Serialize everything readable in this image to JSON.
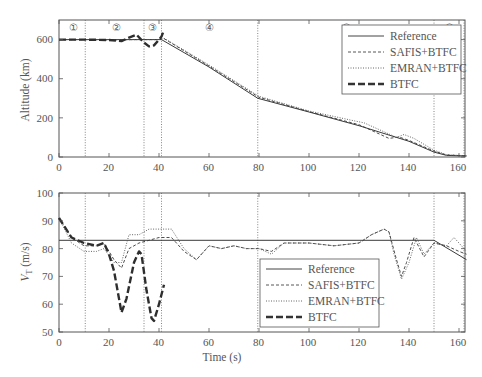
{
  "chart_data": [
    {
      "type": "line",
      "title": "",
      "xlabel": "",
      "ylabel": "Altitude (km)",
      "xlim": [
        0,
        163
      ],
      "ylim": [
        0,
        700
      ],
      "xticks": [
        0,
        20,
        40,
        60,
        80,
        100,
        120,
        140,
        160
      ],
      "yticks": [
        0,
        200,
        400,
        600
      ],
      "grid": false,
      "legend_position": "upper right",
      "phase_markers": [
        {
          "label": "①",
          "x": 5
        },
        {
          "label": "②",
          "x": 23
        },
        {
          "label": "③",
          "x": 37.5
        },
        {
          "label": "④",
          "x": 60
        },
        {
          "label": "⑤",
          "x": 115
        },
        {
          "label": "⑥",
          "x": 156
        }
      ],
      "vertical_lines": [
        10.5,
        34,
        41,
        79.5,
        150,
        162
      ],
      "series": [
        {
          "name": "Reference",
          "style": "solid",
          "x": [
            0,
            10,
            20,
            30,
            40,
            41,
            60,
            79.5,
            100,
            120,
            140,
            150,
            155,
            163
          ],
          "y": [
            600,
            600,
            600,
            600,
            600,
            600,
            460,
            300,
            230,
            160,
            80,
            25,
            8,
            5
          ]
        },
        {
          "name": "SAFIS+BTFC",
          "style": "dashed",
          "x": [
            0,
            10,
            20,
            30,
            40,
            42,
            60,
            80,
            100,
            120,
            132,
            136,
            140,
            150,
            155,
            163
          ],
          "y": [
            600,
            600,
            598,
            600,
            600,
            605,
            465,
            305,
            232,
            165,
            95,
            102,
            85,
            30,
            10,
            6
          ]
        },
        {
          "name": "EMRAN+BTFC",
          "style": "dotted",
          "x": [
            0,
            10,
            20,
            30,
            40,
            42,
            60,
            80,
            100,
            118,
            122,
            135,
            138,
            142,
            150,
            155,
            163
          ],
          "y": [
            600,
            600,
            600,
            600,
            600,
            607,
            470,
            310,
            235,
            185,
            175,
            100,
            115,
            95,
            35,
            12,
            6
          ]
        },
        {
          "name": "BTFC",
          "style": "thick-dashed",
          "x": [
            0,
            10,
            20,
            25,
            28,
            31,
            34,
            36,
            38,
            40,
            41,
            42
          ],
          "y": [
            600,
            600,
            598,
            592,
            610,
            625,
            585,
            565,
            570,
            600,
            615,
            650
          ]
        }
      ]
    },
    {
      "type": "line",
      "title": "",
      "xlabel": "Time (s)",
      "ylabel": "V_T (m/s)",
      "xlim": [
        0,
        163
      ],
      "ylim": [
        50,
        100
      ],
      "xticks": [
        0,
        20,
        40,
        60,
        80,
        100,
        120,
        140,
        160
      ],
      "yticks": [
        50,
        60,
        70,
        80,
        90,
        100
      ],
      "grid": false,
      "legend_position": "lower center-right",
      "vertical_lines": [
        10.5,
        34,
        41,
        79.5,
        150,
        162
      ],
      "series": [
        {
          "name": "Reference",
          "style": "solid",
          "x": [
            0,
            150,
            163
          ],
          "y": [
            83,
            83,
            76
          ]
        },
        {
          "name": "SAFIS+BTFC",
          "style": "dashed",
          "x": [
            0,
            5,
            10,
            15,
            18,
            22,
            25,
            28,
            32,
            36,
            40,
            45,
            50,
            55,
            60,
            65,
            70,
            75,
            80,
            85,
            90,
            100,
            110,
            120,
            125,
            130,
            132,
            135,
            137,
            139,
            142,
            146,
            150,
            155,
            160,
            163
          ],
          "y": [
            91,
            84,
            81,
            81,
            82,
            76,
            73,
            80,
            82,
            83,
            84,
            84,
            79,
            76,
            81,
            80,
            81,
            80,
            80,
            79,
            82,
            82,
            81,
            82,
            85,
            87,
            86,
            76,
            70,
            75,
            84,
            77,
            82,
            81,
            79,
            78
          ]
        },
        {
          "name": "EMRAN+BTFC",
          "style": "dotted",
          "x": [
            0,
            5,
            10,
            15,
            18,
            22,
            25,
            28,
            32,
            36,
            40,
            45,
            50,
            55,
            60,
            65,
            70,
            75,
            80,
            85,
            90,
            100,
            110,
            120,
            125,
            130,
            132,
            134,
            137,
            140,
            143,
            146,
            150,
            155,
            158,
            163
          ],
          "y": [
            91,
            82,
            79,
            79,
            80,
            75,
            75,
            85,
            85,
            87,
            87,
            87,
            80,
            76,
            81,
            80,
            81,
            80,
            80,
            78,
            82,
            82,
            81,
            82,
            85,
            87,
            86,
            78,
            69,
            75,
            84,
            78,
            82,
            81,
            84,
            79
          ]
        },
        {
          "name": "BTFC",
          "style": "thick-dashed",
          "x": [
            0,
            5,
            10,
            15,
            18,
            20,
            22,
            25,
            27,
            30,
            32,
            33,
            35,
            37,
            38,
            40,
            42
          ],
          "y": [
            91,
            84,
            82,
            81,
            82,
            78,
            72,
            57,
            62,
            75,
            79,
            78,
            65,
            55,
            54,
            60,
            67
          ]
        }
      ]
    }
  ],
  "top_plot": {
    "ylabel": "Altitude (km)",
    "yticks": [
      "0",
      "200",
      "400",
      "600"
    ],
    "xticks": [
      "0",
      "20",
      "40",
      "60",
      "80",
      "100",
      "120",
      "140",
      "160"
    ],
    "phases": [
      "①",
      "②",
      "③",
      "④",
      "⑤",
      "⑥"
    ],
    "legend": [
      "Reference",
      "SAFIS+BTFC",
      "EMRAN+BTFC",
      "BTFC"
    ]
  },
  "bottom_plot": {
    "ylabel_main": "V",
    "ylabel_sub": "T",
    "ylabel_unit": " (m/s)",
    "xlabel": "Time (s)",
    "yticks": [
      "50",
      "60",
      "70",
      "80",
      "90",
      "100"
    ],
    "xticks": [
      "0",
      "20",
      "40",
      "60",
      "80",
      "100",
      "120",
      "140",
      "160"
    ],
    "legend": [
      "Reference",
      "SAFIS+BTFC",
      "EMRAN+BTFC",
      "BTFC"
    ]
  },
  "colors": {
    "axis": "#555555",
    "line": "#333333",
    "text": "#555555",
    "background": "#ffffff"
  }
}
